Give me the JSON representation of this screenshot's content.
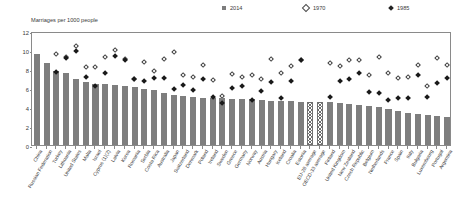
{
  "figure": {
    "axis_title": "Marriages per 1000 people",
    "legend": [
      {
        "label": "2014",
        "marker": "filled-square-icon",
        "color": "#7d7d7d"
      },
      {
        "label": "1970",
        "marker": "open-diamond-icon",
        "color": "#ffffff"
      },
      {
        "label": "1985",
        "marker": "filled-diamond-icon",
        "color": "#1a1a1a"
      }
    ]
  },
  "chart_data": {
    "type": "bar",
    "title": "Marriages per 1000 people",
    "xlabel": "",
    "ylabel": "Marriages per 1000 people",
    "ylim": [
      0,
      12
    ],
    "yticks": [
      0,
      2,
      4,
      6,
      8,
      10,
      12
    ],
    "grid": false,
    "legend_position": "top",
    "categories": [
      "China",
      "Russian Federation",
      "Turkey",
      "Lithuania",
      "United States",
      "Malta",
      "Israel",
      "Cyprus (1)(2)",
      "Latvia",
      "Korea",
      "Romania",
      "Serbia",
      "Costa Rica",
      "Australia",
      "Japan",
      "Switzerland",
      "Denmark",
      "Poland",
      "Ireland",
      "Sweden",
      "Greece",
      "Germany",
      "Norway",
      "Austria",
      "Hungary",
      "Iceland",
      "Croatia",
      "Estonia",
      "EU-28 average",
      "OECD-33 average",
      "Finland",
      "United Kingdom",
      "New Zealand",
      "Czech Republic",
      "Belgium",
      "Netherlands",
      "France",
      "Spain",
      "Italy",
      "Bulgaria",
      "Luxembourg",
      "Portugal",
      "Argentina"
    ],
    "series": [
      {
        "name": "2014",
        "marker": "bar",
        "values": [
          9.6,
          8.6,
          7.8,
          7.6,
          6.9,
          6.6,
          6.4,
          6.4,
          6.3,
          6.2,
          6.1,
          5.9,
          5.8,
          5.5,
          5.3,
          5.2,
          5.1,
          5.0,
          4.9,
          4.9,
          4.8,
          4.8,
          4.8,
          4.7,
          4.6,
          4.6,
          4.6,
          4.5,
          4.5,
          4.5,
          4.5,
          4.4,
          4.3,
          4.2,
          4.1,
          4.0,
          3.8,
          3.6,
          3.4,
          3.3,
          3.2,
          3.1,
          3.0
        ]
      },
      {
        "name": "1970",
        "marker": "open-diamond",
        "values": [
          null,
          null,
          9.8,
          9.5,
          10.6,
          8.4,
          8.4,
          9.5,
          10.2,
          9.3,
          7.2,
          8.9,
          8.0,
          9.3,
          10.0,
          7.6,
          7.4,
          8.6,
          7.0,
          5.4,
          7.7,
          7.4,
          7.6,
          7.1,
          9.3,
          7.8,
          8.5,
          9.2,
          null,
          null,
          8.8,
          8.5,
          9.2,
          9.2,
          7.6,
          9.5,
          7.8,
          7.3,
          7.4,
          8.6,
          6.4,
          9.4,
          8.6
        ]
      },
      {
        "name": "1985",
        "marker": "filled-diamond",
        "values": [
          null,
          null,
          7.9,
          9.4,
          10.1,
          7.4,
          6.4,
          7.8,
          9.6,
          9.2,
          7.1,
          6.9,
          7.3,
          7.3,
          6.1,
          6.5,
          6.0,
          7.2,
          5.3,
          4.6,
          6.2,
          6.4,
          4.9,
          5.9,
          6.8,
          5.1,
          6.9,
          9.1,
          null,
          null,
          5.3,
          6.9,
          7.1,
          7.8,
          5.8,
          5.7,
          4.9,
          5.2,
          5.2,
          7.6,
          5.3,
          6.7,
          7.3
        ]
      }
    ],
    "notes": [
      "EU-28 average and OECD-33 average bars are drawn with a hatched pattern."
    ]
  }
}
